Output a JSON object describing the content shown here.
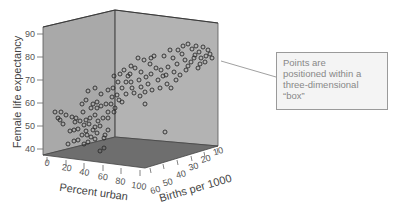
{
  "chart_data": {
    "type": "scatter",
    "subtype": "3d-scatter",
    "title": "",
    "xlabel": "Percent urban",
    "ylabel": "Female life expectancy",
    "zlabel": "Births per 1000",
    "x_ticks": [
      0,
      20,
      40,
      60,
      80,
      100
    ],
    "y_ticks": [
      40,
      50,
      60,
      70,
      80,
      90
    ],
    "z_ticks": [
      60,
      50,
      40,
      30,
      20,
      10
    ],
    "xlim": [
      0,
      100
    ],
    "ylim": [
      40,
      90
    ],
    "zlim": [
      10,
      60
    ],
    "annotation": "Points are positioned within a three-dimensional “box”",
    "points_screen": [
      [
        55,
        112
      ],
      [
        61,
        112
      ],
      [
        66,
        115
      ],
      [
        58,
        118
      ],
      [
        72,
        117
      ],
      [
        60,
        120
      ],
      [
        63,
        124
      ],
      [
        76,
        118
      ],
      [
        83,
        112
      ],
      [
        90,
        118
      ],
      [
        75,
        122
      ],
      [
        80,
        121
      ],
      [
        86,
        120
      ],
      [
        89,
        124
      ],
      [
        95,
        115
      ],
      [
        98,
        121
      ],
      [
        95,
        127
      ],
      [
        100,
        126
      ],
      [
        103,
        118
      ],
      [
        108,
        118
      ],
      [
        70,
        131
      ],
      [
        74,
        130
      ],
      [
        78,
        129
      ],
      [
        84,
        125
      ],
      [
        86,
        131
      ],
      [
        82,
        135
      ],
      [
        87,
        135
      ],
      [
        93,
        130
      ],
      [
        97,
        133
      ],
      [
        91,
        137
      ],
      [
        78,
        140
      ],
      [
        88,
        142
      ],
      [
        95,
        139
      ],
      [
        68,
        144
      ],
      [
        74,
        141
      ],
      [
        105,
        135
      ],
      [
        108,
        130
      ],
      [
        104,
        138
      ],
      [
        115,
        108
      ],
      [
        108,
        112
      ],
      [
        82,
        104
      ],
      [
        86,
        100
      ],
      [
        93,
        104
      ],
      [
        97,
        102
      ],
      [
        101,
        106
      ],
      [
        106,
        104
      ],
      [
        112,
        97
      ],
      [
        111,
        104
      ],
      [
        97,
        108
      ],
      [
        91,
        108
      ],
      [
        88,
        91
      ],
      [
        95,
        88
      ],
      [
        101,
        94
      ],
      [
        108,
        90
      ],
      [
        113,
        88
      ],
      [
        117,
        95
      ],
      [
        119,
        100
      ],
      [
        122,
        102
      ],
      [
        126,
        94
      ],
      [
        122,
        88
      ],
      [
        126,
        82
      ],
      [
        131,
        82
      ],
      [
        128,
        76
      ],
      [
        124,
        70
      ],
      [
        131,
        66
      ],
      [
        135,
        68
      ],
      [
        141,
        72
      ],
      [
        139,
        80
      ],
      [
        146,
        77
      ],
      [
        151,
        74
      ],
      [
        148,
        84
      ],
      [
        141,
        87
      ],
      [
        134,
        93
      ],
      [
        145,
        92
      ],
      [
        152,
        90
      ],
      [
        160,
        88
      ],
      [
        167,
        84
      ],
      [
        158,
        80
      ],
      [
        163,
        76
      ],
      [
        161,
        70
      ],
      [
        168,
        67
      ],
      [
        174,
        72
      ],
      [
        177,
        64
      ],
      [
        173,
        58
      ],
      [
        178,
        50
      ],
      [
        182,
        54
      ],
      [
        185,
        60
      ],
      [
        188,
        66
      ],
      [
        191,
        62
      ],
      [
        195,
        55
      ],
      [
        192,
        49
      ],
      [
        196,
        46
      ],
      [
        199,
        52
      ],
      [
        201,
        58
      ],
      [
        203,
        47
      ],
      [
        206,
        56
      ],
      [
        208,
        50
      ],
      [
        205,
        62
      ],
      [
        212,
        58
      ],
      [
        198,
        68
      ],
      [
        186,
        70
      ],
      [
        180,
        75
      ],
      [
        176,
        80
      ],
      [
        171,
        88
      ],
      [
        166,
        75
      ],
      [
        156,
        68
      ],
      [
        150,
        64
      ],
      [
        144,
        60
      ],
      [
        138,
        58
      ],
      [
        130,
        74
      ],
      [
        118,
        82
      ],
      [
        114,
        76
      ],
      [
        120,
        74
      ],
      [
        132,
        88
      ],
      [
        140,
        96
      ],
      [
        145,
        104
      ],
      [
        154,
        56
      ],
      [
        164,
        56
      ],
      [
        170,
        50
      ],
      [
        183,
        46
      ],
      [
        188,
        44
      ],
      [
        194,
        58
      ],
      [
        200,
        64
      ],
      [
        210,
        54
      ],
      [
        114,
        112
      ],
      [
        84,
        144
      ],
      [
        165,
        132
      ],
      [
        104,
        148
      ],
      [
        100,
        151
      ],
      [
        151,
        58
      ]
    ]
  },
  "labels": {
    "x_ticks": [
      "0",
      "20",
      "40",
      "60",
      "80",
      "100"
    ],
    "y_ticks": [
      "90",
      "80",
      "70",
      "60",
      "50",
      "40"
    ],
    "z_ticks": [
      "60",
      "50",
      "40",
      "30",
      "20",
      "10"
    ],
    "x_title": "Percent urban",
    "y_title": "Female life expectancy",
    "z_title": "Births per 1000",
    "callout_line1": "Points are",
    "callout_line2": "positioned within a",
    "callout_line3": "three-dimensional",
    "callout_line4": "“box”"
  },
  "colors": {
    "left_wall": "#a9a9a9",
    "right_wall": "#b3b3b3",
    "floor": "#6e6e6e",
    "edge": "#3a3a3a",
    "point": "#2b2b2b"
  }
}
